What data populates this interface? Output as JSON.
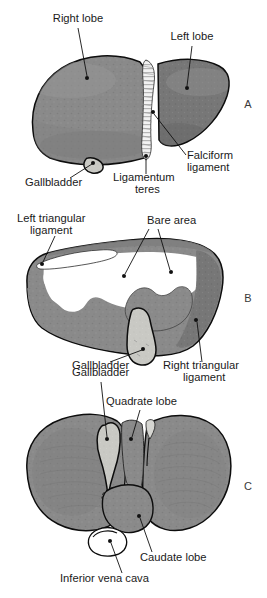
{
  "figure": {
    "background_color": "#ffffff",
    "width": 267,
    "height": 598,
    "colors": {
      "liver_gray": "#8a8a8a",
      "liver_gray_dark": "#6f6f6f",
      "liver_gray_light": "#9b9b9b",
      "gallbladder_light": "#c9c9c4",
      "bare_area_white": "#ffffff",
      "outline_black": "#0d0d0d",
      "text_black": "#1a1a1a",
      "panel_letter_gray": "#3a3a3a"
    }
  },
  "panels": [
    {
      "id": "panel-a",
      "letter": "A",
      "letter_x": 248,
      "letter_y": 108,
      "view": "anterior surface",
      "labels": [
        {
          "id": "right-lobe",
          "text": "Right lobe",
          "text_x": 78,
          "text_y": 22,
          "anchor": "middle",
          "leader": "M 78,28 L 87,76",
          "dot_x": 87,
          "dot_y": 78
        },
        {
          "id": "left-lobe",
          "text": "Left lobe",
          "text_x": 192,
          "text_y": 40,
          "anchor": "middle",
          "leader": "M 192,46 L 187,86",
          "dot_x": 187,
          "dot_y": 88
        },
        {
          "id": "falciform-ligament",
          "text": "Falciform",
          "text_x": 187,
          "text_y": 159,
          "anchor": "start",
          "leader": "M 186,155 L 154,114",
          "dot_x": 153,
          "dot_y": 112
        },
        {
          "id": "falciform-ligament-line2",
          "text": "ligament",
          "text_x": 187,
          "text_y": 171,
          "anchor": "start",
          "leader": "",
          "dot_x": null,
          "dot_y": null
        },
        {
          "id": "ligamentum-teres",
          "text": "Ligamentum",
          "text_x": 113,
          "text_y": 181,
          "anchor": "start",
          "leader": "M 146,174 L 146,158",
          "dot_x": 146,
          "dot_y": 156
        },
        {
          "id": "ligamentum-teres-line2",
          "text": "teres",
          "text_x": 135,
          "text_y": 193,
          "anchor": "start",
          "leader": "",
          "dot_x": null,
          "dot_y": null
        },
        {
          "id": "gallbladder-a",
          "text": "Gallbladder",
          "text_x": 25,
          "text_y": 186,
          "anchor": "start",
          "leader": "M 70,178 L 92,164",
          "dot_x": 93,
          "dot_y": 163
        }
      ]
    },
    {
      "id": "panel-b",
      "letter": "B",
      "letter_x": 248,
      "letter_y": 302,
      "view": "posterior surface",
      "labels": [
        {
          "id": "left-triangular-ligament",
          "text": "Left triangular",
          "text_x": 17,
          "text_y": 222,
          "anchor": "start",
          "leader": "M 55,236 L 43,262",
          "dot_x": 42,
          "dot_y": 264
        },
        {
          "id": "left-triangular-ligament-line2",
          "text": "ligament",
          "text_x": 30,
          "text_y": 234,
          "anchor": "start",
          "leader": "",
          "dot_x": null,
          "dot_y": null
        },
        {
          "id": "bare-area",
          "text": "Bare area",
          "text_x": 147,
          "text_y": 224,
          "anchor": "start",
          "leader": "M 149,229 L 125,274",
          "dot_x": 124,
          "dot_y": 276
        },
        {
          "id": "bare-area-second-leader",
          "text": "",
          "text_x": 0,
          "text_y": 0,
          "anchor": "start",
          "leader": "M 158,229 L 170,270",
          "dot_x": 171,
          "dot_y": 272
        },
        {
          "id": "gallbladder-b",
          "text": "Gallbladder",
          "text_x": 72,
          "text_y": 369,
          "anchor": "start",
          "leader": "M 110,362 L 142,350",
          "dot_x": 143,
          "dot_y": 349
        },
        {
          "id": "right-triangular-ligament",
          "text": "Right triangular",
          "text_x": 163,
          "text_y": 369,
          "anchor": "start",
          "leader": "M 202,362 L 197,322",
          "dot_x": 196,
          "dot_y": 320
        },
        {
          "id": "right-triangular-ligament-line2",
          "text": "ligament",
          "text_x": 183,
          "text_y": 381,
          "anchor": "start",
          "leader": "",
          "dot_x": null,
          "dot_y": null
        }
      ]
    },
    {
      "id": "panel-c",
      "letter": "C",
      "letter_x": 248,
      "letter_y": 490,
      "view": "inferior (visceral) surface",
      "labels": [
        {
          "id": "gallbladder-c",
          "text": "Gallbladder",
          "text_x": 72,
          "text_y": 376,
          "anchor": "start",
          "leader": "M 101,382 L 107,437",
          "dot_x": 107,
          "dot_y": 439
        },
        {
          "id": "quadrate-lobe",
          "text": "Quadrate lobe",
          "text_x": 106,
          "text_y": 405,
          "anchor": "start",
          "leader": "M 140,410 L 132,437",
          "dot_x": 131,
          "dot_y": 439
        },
        {
          "id": "caudate-lobe",
          "text": "Caudate lobe",
          "text_x": 140,
          "text_y": 561,
          "anchor": "start",
          "leader": "M 152,552 L 140,518",
          "dot_x": 139,
          "dot_y": 516
        },
        {
          "id": "inferior-vena-cava",
          "text": "Inferior vena cava",
          "text_x": 60,
          "text_y": 582,
          "anchor": "start",
          "leader": "M 122,573 L 111,543",
          "dot_x": 110,
          "dot_y": 541
        }
      ]
    }
  ]
}
